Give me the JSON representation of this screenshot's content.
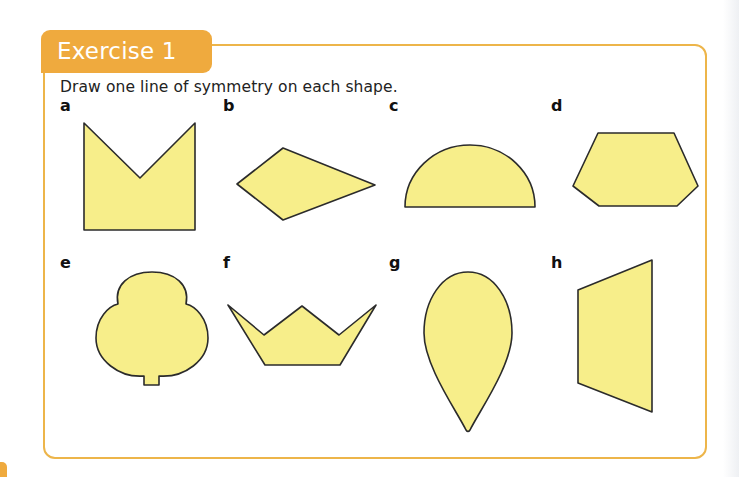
{
  "exercise": {
    "title": "Exercise 1",
    "instruction": "Draw one line of symmetry on each shape.",
    "accent_color": "#EFAA3E",
    "shape_fill_color": "#F7EE8A",
    "items": [
      {
        "label": "a",
        "shape": "M-shape (rectangle with V notch)"
      },
      {
        "label": "b",
        "shape": "kite"
      },
      {
        "label": "c",
        "shape": "semicircle"
      },
      {
        "label": "d",
        "shape": "hexagon"
      },
      {
        "label": "e",
        "shape": "tree (trefoil with stem)"
      },
      {
        "label": "f",
        "shape": "crown"
      },
      {
        "label": "g",
        "shape": "teardrop"
      },
      {
        "label": "h",
        "shape": "trapezium"
      }
    ]
  }
}
